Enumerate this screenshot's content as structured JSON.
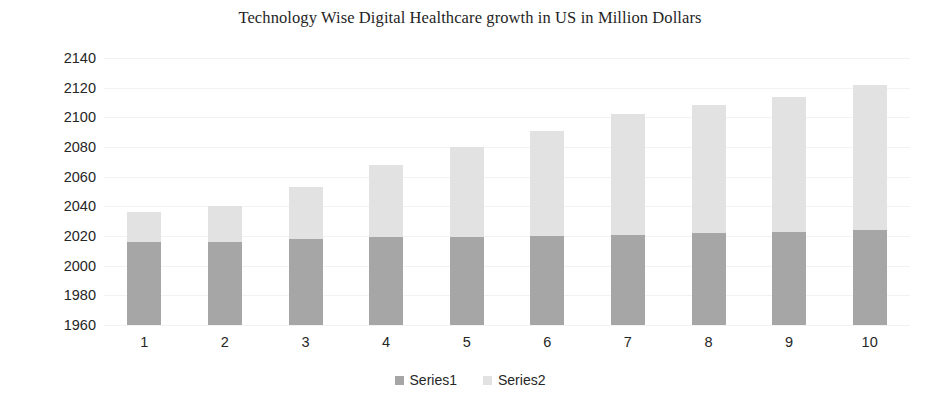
{
  "chart_data": {
    "type": "bar",
    "subtype": "stacked-column",
    "title": "Technology Wise Digital Healthcare growth in US in Million Dollars",
    "xlabel": "",
    "ylabel": "",
    "categories": [
      "1",
      "2",
      "3",
      "4",
      "5",
      "6",
      "7",
      "8",
      "9",
      "10"
    ],
    "series": [
      {
        "name": "Series1",
        "color": "#a6a6a6",
        "values": [
          2016,
          2016,
          2018,
          2019,
          2019,
          2020,
          2021,
          2022,
          2023,
          2024
        ]
      },
      {
        "name": "Series2",
        "color": "#e2e2e2",
        "values": [
          20,
          24,
          35,
          49,
          61,
          71,
          81,
          86,
          91,
          98
        ]
      }
    ],
    "stacked_totals": [
      2036,
      2040,
      2053,
      2067,
      2080,
      2091,
      2102,
      2108,
      2114,
      2122
    ],
    "ylim": [
      1960,
      2140
    ],
    "ytick_step": 20,
    "ytick_labels": [
      "2140",
      "2120",
      "2100",
      "2080",
      "2060",
      "2040",
      "2020",
      "2000",
      "1980",
      "1960"
    ],
    "ytick_values": [
      2140,
      2120,
      2100,
      2080,
      2060,
      2040,
      2020,
      2000,
      1980,
      1960
    ],
    "grid": true,
    "grid_color": "#f2f2f2",
    "legend_position": "bottom",
    "legend": [
      {
        "label": "Series1",
        "color": "#a6a6a6"
      },
      {
        "label": "Series2",
        "color": "#e2e2e2"
      }
    ],
    "background": "#ffffff"
  }
}
